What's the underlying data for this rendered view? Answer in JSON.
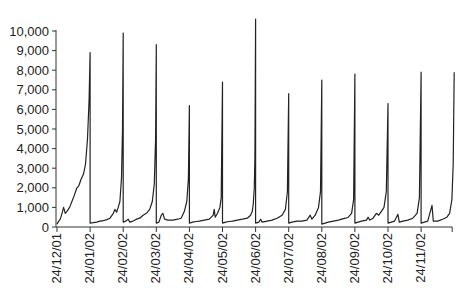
{
  "chart_data": {
    "type": "line",
    "title": "",
    "xlabel": "",
    "ylabel": "",
    "ylim": [
      0,
      10000
    ],
    "yticks": [
      0,
      1000,
      2000,
      3000,
      4000,
      5000,
      6000,
      7000,
      8000,
      9000,
      10000
    ],
    "ytick_labels": [
      "0",
      "1,000",
      "2,000",
      "3,000",
      "4,000",
      "5,000",
      "6,000",
      "7,000",
      "8,000",
      "9,000",
      "10,000"
    ],
    "xtick_labels": [
      "24/12/01",
      "24/01/02",
      "24/02/02",
      "24/03/02",
      "24/04/02",
      "24/05/02",
      "24/06/02",
      "24/07/02",
      "24/08/02",
      "24/09/02",
      "24/10/02",
      "24/11/02"
    ],
    "grid": false,
    "legend": null,
    "line_color": "#222222",
    "series": [
      {
        "name": "value",
        "description": "Monthly sawtooth: value resets low after each period start, grows roughly exponentially, spikes at the period boundary.",
        "cycles": [
          {
            "start": "24/12/01",
            "end": "24/01/02",
            "start_value": 150,
            "peak": 8900
          },
          {
            "start": "24/01/02",
            "end": "24/02/02",
            "start_value": 250,
            "peak": 9900
          },
          {
            "start": "24/02/02",
            "end": "24/03/02",
            "start_value": 200,
            "peak": 9300
          },
          {
            "start": "24/03/02",
            "end": "24/04/02",
            "start_value": 180,
            "peak": 6200
          },
          {
            "start": "24/04/02",
            "end": "24/05/02",
            "start_value": 200,
            "peak": 7400
          },
          {
            "start": "24/05/02",
            "end": "24/06/02",
            "start_value": 200,
            "peak": 10600
          },
          {
            "start": "24/06/02",
            "end": "24/07/02",
            "start_value": 180,
            "peak": 6800
          },
          {
            "start": "24/07/02",
            "end": "24/08/02",
            "start_value": 200,
            "peak": 7500
          },
          {
            "start": "24/08/02",
            "end": "24/09/02",
            "start_value": 200,
            "peak": 7800
          },
          {
            "start": "24/09/02",
            "end": "24/10/02",
            "start_value": 180,
            "peak": 6300
          },
          {
            "start": "24/10/02",
            "end": "24/11/02",
            "start_value": 200,
            "peak": 7900
          },
          {
            "start": "24/11/02",
            "end": "24/12/02",
            "start_value": 200,
            "peak": 7900
          }
        ],
        "points": [
          [
            0.0,
            150
          ],
          [
            0.05,
            300
          ],
          [
            0.1,
            400
          ],
          [
            0.15,
            700
          ],
          [
            0.2,
            1000
          ],
          [
            0.25,
            700
          ],
          [
            0.3,
            800
          ],
          [
            0.38,
            1000
          ],
          [
            0.45,
            1300
          ],
          [
            0.52,
            1600
          ],
          [
            0.6,
            2000
          ],
          [
            0.66,
            2100
          ],
          [
            0.72,
            2400
          ],
          [
            0.8,
            2700
          ],
          [
            0.86,
            3200
          ],
          [
            0.92,
            4500
          ],
          [
            0.97,
            6500
          ],
          [
            1.0,
            8900
          ],
          [
            1.0,
            200
          ],
          [
            1.1,
            220
          ],
          [
            1.2,
            250
          ],
          [
            1.3,
            300
          ],
          [
            1.4,
            320
          ],
          [
            1.5,
            380
          ],
          [
            1.6,
            450
          ],
          [
            1.7,
            700
          ],
          [
            1.75,
            900
          ],
          [
            1.8,
            750
          ],
          [
            1.85,
            1000
          ],
          [
            1.9,
            1300
          ],
          [
            1.95,
            2500
          ],
          [
            1.98,
            5000
          ],
          [
            2.0,
            9900
          ],
          [
            2.0,
            250
          ],
          [
            2.08,
            300
          ],
          [
            2.15,
            400
          ],
          [
            2.2,
            250
          ],
          [
            2.3,
            300
          ],
          [
            2.4,
            400
          ],
          [
            2.5,
            450
          ],
          [
            2.6,
            600
          ],
          [
            2.7,
            700
          ],
          [
            2.8,
            900
          ],
          [
            2.88,
            1300
          ],
          [
            2.94,
            2200
          ],
          [
            2.98,
            4500
          ],
          [
            3.0,
            9300
          ],
          [
            3.0,
            200
          ],
          [
            3.08,
            250
          ],
          [
            3.15,
            600
          ],
          [
            3.2,
            700
          ],
          [
            3.25,
            400
          ],
          [
            3.35,
            350
          ],
          [
            3.5,
            350
          ],
          [
            3.65,
            400
          ],
          [
            3.75,
            450
          ],
          [
            3.85,
            800
          ],
          [
            3.92,
            1300
          ],
          [
            3.97,
            2500
          ],
          [
            4.0,
            6200
          ],
          [
            4.0,
            200
          ],
          [
            4.1,
            250
          ],
          [
            4.2,
            280
          ],
          [
            4.3,
            300
          ],
          [
            4.45,
            350
          ],
          [
            4.6,
            400
          ],
          [
            4.72,
            600
          ],
          [
            4.75,
            900
          ],
          [
            4.78,
            500
          ],
          [
            4.85,
            700
          ],
          [
            4.92,
            1000
          ],
          [
            4.96,
            1500
          ],
          [
            5.0,
            7400
          ],
          [
            5.0,
            200
          ],
          [
            5.1,
            250
          ],
          [
            5.2,
            280
          ],
          [
            5.3,
            300
          ],
          [
            5.45,
            350
          ],
          [
            5.6,
            400
          ],
          [
            5.75,
            450
          ],
          [
            5.85,
            600
          ],
          [
            5.9,
            800
          ],
          [
            5.93,
            1200
          ],
          [
            5.96,
            2000
          ],
          [
            5.98,
            3500
          ],
          [
            6.0,
            10600
          ],
          [
            6.0,
            200
          ],
          [
            6.1,
            250
          ],
          [
            6.15,
            400
          ],
          [
            6.2,
            250
          ],
          [
            6.35,
            300
          ],
          [
            6.5,
            350
          ],
          [
            6.65,
            450
          ],
          [
            6.8,
            600
          ],
          [
            6.9,
            900
          ],
          [
            6.96,
            1800
          ],
          [
            7.0,
            6800
          ],
          [
            7.0,
            200
          ],
          [
            7.1,
            250
          ],
          [
            7.25,
            300
          ],
          [
            7.4,
            300
          ],
          [
            7.55,
            350
          ],
          [
            7.65,
            600
          ],
          [
            7.7,
            400
          ],
          [
            7.8,
            600
          ],
          [
            7.9,
            1000
          ],
          [
            7.96,
            1800
          ],
          [
            8.0,
            7500
          ],
          [
            8.0,
            150
          ],
          [
            8.1,
            200
          ],
          [
            8.2,
            250
          ],
          [
            8.35,
            300
          ],
          [
            8.5,
            350
          ],
          [
            8.6,
            400
          ],
          [
            8.72,
            450
          ],
          [
            8.8,
            500
          ],
          [
            8.9,
            700
          ],
          [
            8.96,
            1400
          ],
          [
            9.0,
            7800
          ],
          [
            9.0,
            200
          ],
          [
            9.1,
            250
          ],
          [
            9.2,
            300
          ],
          [
            9.35,
            350
          ],
          [
            9.4,
            500
          ],
          [
            9.45,
            350
          ],
          [
            9.55,
            450
          ],
          [
            9.65,
            700
          ],
          [
            9.72,
            600
          ],
          [
            9.8,
            800
          ],
          [
            9.88,
            1000
          ],
          [
            9.95,
            1800
          ],
          [
            10.0,
            6300
          ],
          [
            10.0,
            200
          ],
          [
            10.1,
            250
          ],
          [
            10.2,
            300
          ],
          [
            10.3,
            650
          ],
          [
            10.34,
            250
          ],
          [
            10.45,
            300
          ],
          [
            10.6,
            350
          ],
          [
            10.75,
            450
          ],
          [
            10.88,
            700
          ],
          [
            10.95,
            1500
          ],
          [
            11.0,
            7900
          ],
          [
            11.0,
            200
          ],
          [
            11.1,
            250
          ],
          [
            11.2,
            300
          ],
          [
            11.33,
            1100
          ],
          [
            11.37,
            300
          ],
          [
            11.5,
            300
          ],
          [
            11.65,
            400
          ],
          [
            11.78,
            500
          ],
          [
            11.86,
            700
          ],
          [
            11.93,
            1400
          ],
          [
            11.97,
            3200
          ],
          [
            12.0,
            7900
          ]
        ]
      }
    ]
  }
}
